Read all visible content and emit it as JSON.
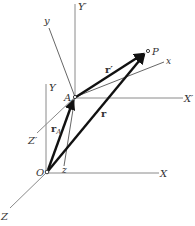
{
  "diagram": {
    "points": {
      "origin": "O",
      "point_a": "A",
      "point_p": "P"
    },
    "fixed_axes": {
      "x": "X",
      "y": "Y",
      "z": "Z"
    },
    "translated_axes": {
      "x": "X′",
      "y": "Y′",
      "z": "Z′"
    },
    "rotating_axes": {
      "x": "x",
      "y": "y",
      "z": "z"
    },
    "vectors": {
      "r_a_main": "r",
      "r_a_sub": "A",
      "r": "r",
      "r_prime": "r′"
    },
    "colors": {
      "axis": "#8a8a8a",
      "vector": "#111111",
      "label": "#333333"
    }
  }
}
